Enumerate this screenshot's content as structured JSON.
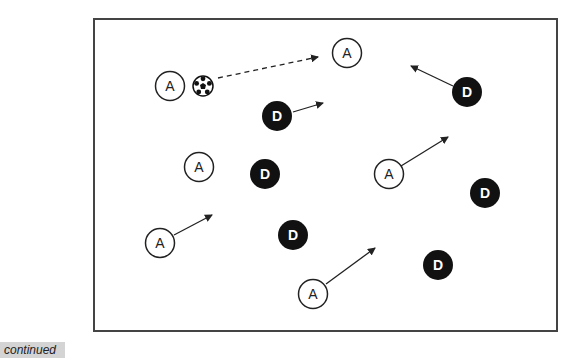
{
  "caption": "continued",
  "colors": {
    "frame": "#444444",
    "attacker_fill": "#ffffff",
    "defender_fill": "#111111",
    "line": "#222222"
  },
  "field": {
    "x": 94,
    "y": 19,
    "width": 463,
    "height": 312
  },
  "ball": {
    "icon": "soccer-ball-icon",
    "x": 203,
    "y": 86,
    "r": 10
  },
  "attackers": [
    {
      "label": "A",
      "x": 170,
      "y": 86
    },
    {
      "label": "A",
      "x": 347,
      "y": 53
    },
    {
      "label": "A",
      "x": 199,
      "y": 167
    },
    {
      "label": "A",
      "x": 389,
      "y": 174
    },
    {
      "label": "A",
      "x": 160,
      "y": 243
    },
    {
      "label": "A",
      "x": 313,
      "y": 294
    }
  ],
  "defenders": [
    {
      "label": "D",
      "x": 467,
      "y": 92
    },
    {
      "label": "D",
      "x": 277,
      "y": 116
    },
    {
      "label": "D",
      "x": 265,
      "y": 174
    },
    {
      "label": "D",
      "x": 485,
      "y": 193
    },
    {
      "label": "D",
      "x": 293,
      "y": 235
    },
    {
      "label": "D",
      "x": 438,
      "y": 265
    }
  ],
  "pass_arrow": {
    "x1": 218,
    "y1": 78,
    "x2": 318,
    "y2": 57,
    "style": "dashed"
  },
  "run_arrows": [
    {
      "x1": 293,
      "y1": 112,
      "x2": 323,
      "y2": 103
    },
    {
      "x1": 453,
      "y1": 86,
      "x2": 411,
      "y2": 66
    },
    {
      "x1": 401,
      "y1": 166,
      "x2": 448,
      "y2": 137
    },
    {
      "x1": 174,
      "y1": 235,
      "x2": 212,
      "y2": 215
    },
    {
      "x1": 326,
      "y1": 284,
      "x2": 375,
      "y2": 248
    }
  ]
}
